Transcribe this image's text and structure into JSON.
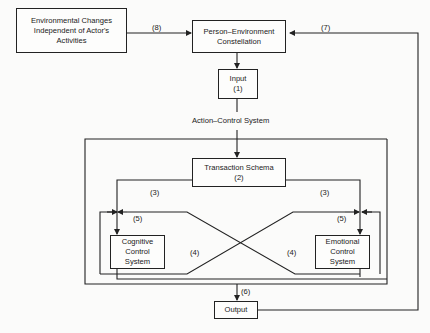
{
  "nodes": {
    "env_changes": {
      "line1": "Environmental Changes",
      "line2": "Independent of Actor's",
      "line3": "Activities"
    },
    "person_env": {
      "line1": "Person–Environment",
      "line2": "Constellation"
    },
    "input": {
      "line1": "Input",
      "line2": "(1)"
    },
    "transaction": {
      "line1": "Transaction Schema",
      "line2": "(2)"
    },
    "cognitive": {
      "line1": "Cognitive",
      "line2": "Control",
      "line3": "System"
    },
    "emotional": {
      "line1": "Emotional",
      "line2": "Control",
      "line3": "System"
    },
    "output": {
      "line1": "Output"
    }
  },
  "labels": {
    "action_control_system": "Action–Control System",
    "edge_8": "(8)",
    "edge_7": "(7)",
    "edge_3_left": "(3)",
    "edge_3_right": "(3)",
    "edge_5_left": "(5)",
    "edge_5_right": "(5)",
    "edge_4_left": "(4)",
    "edge_4_right": "(4)",
    "edge_6": "(6)"
  }
}
